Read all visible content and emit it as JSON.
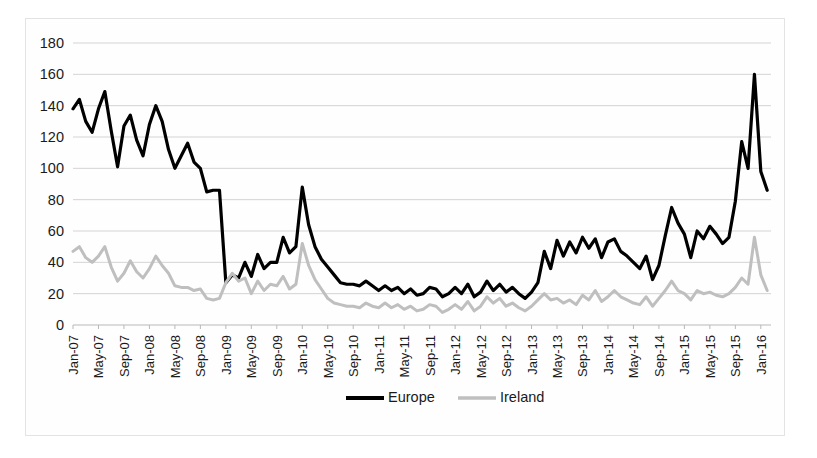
{
  "chart_data": {
    "type": "line",
    "title": "",
    "subtitle": "",
    "xlabel": "",
    "ylabel": "",
    "ylim": [
      0,
      180
    ],
    "ytick_values": [
      0,
      20,
      40,
      60,
      80,
      100,
      120,
      140,
      160,
      180
    ],
    "ytick_labels": [
      "0",
      "20",
      "40",
      "60",
      "80",
      "100",
      "120",
      "140",
      "160",
      "180"
    ],
    "grid": true,
    "grid_axis": "y",
    "legend_position": "bottom",
    "legend_entries": [
      "Europe",
      "Ireland"
    ],
    "x_start": "Jan-07",
    "x_end": "Feb-16",
    "x_tick_step_months": 4,
    "xtick_labels": [
      "Jan-07",
      "May-07",
      "Sep-07",
      "Jan-08",
      "May-08",
      "Sep-08",
      "Jan-09",
      "May-09",
      "Sep-09",
      "Jan-10",
      "May-10",
      "Sep-10",
      "Jan-11",
      "May-11",
      "Sep-11",
      "Jan-12",
      "May-12",
      "Sep-12",
      "Jan-13",
      "May-13",
      "Sep-13",
      "Jan-14",
      "May-14",
      "Sep-14",
      "Jan-15",
      "May-15",
      "Sep-15",
      "Jan-16"
    ],
    "x": [
      "Jan-07",
      "Feb-07",
      "Mar-07",
      "Apr-07",
      "May-07",
      "Jun-07",
      "Jul-07",
      "Aug-07",
      "Sep-07",
      "Oct-07",
      "Nov-07",
      "Dec-07",
      "Jan-08",
      "Feb-08",
      "Mar-08",
      "Apr-08",
      "May-08",
      "Jun-08",
      "Jul-08",
      "Aug-08",
      "Sep-08",
      "Oct-08",
      "Nov-08",
      "Dec-08",
      "Jan-09",
      "Feb-09",
      "Mar-09",
      "Apr-09",
      "May-09",
      "Jun-09",
      "Jul-09",
      "Aug-09",
      "Sep-09",
      "Oct-09",
      "Nov-09",
      "Dec-09",
      "Jan-10",
      "Feb-10",
      "Mar-10",
      "Apr-10",
      "May-10",
      "Jun-10",
      "Jul-10",
      "Aug-10",
      "Sep-10",
      "Oct-10",
      "Nov-10",
      "Dec-10",
      "Jan-11",
      "Feb-11",
      "Mar-11",
      "Apr-11",
      "May-11",
      "Jun-11",
      "Jul-11",
      "Aug-11",
      "Sep-11",
      "Oct-11",
      "Nov-11",
      "Dec-11",
      "Jan-12",
      "Feb-12",
      "Mar-12",
      "Apr-12",
      "May-12",
      "Jun-12",
      "Jul-12",
      "Aug-12",
      "Sep-12",
      "Oct-12",
      "Nov-12",
      "Dec-12",
      "Jan-13",
      "Feb-13",
      "Mar-13",
      "Apr-13",
      "May-13",
      "Jun-13",
      "Jul-13",
      "Aug-13",
      "Sep-13",
      "Oct-13",
      "Nov-13",
      "Dec-13",
      "Jan-14",
      "Feb-14",
      "Mar-14",
      "Apr-14",
      "May-14",
      "Jun-14",
      "Jul-14",
      "Aug-14",
      "Sep-14",
      "Oct-14",
      "Nov-14",
      "Dec-14",
      "Jan-15",
      "Feb-15",
      "Mar-15",
      "Apr-15",
      "May-15",
      "Jun-15",
      "Jul-15",
      "Aug-15",
      "Sep-15",
      "Oct-15",
      "Nov-15",
      "Dec-15",
      "Jan-16",
      "Feb-16"
    ],
    "series": [
      {
        "name": "Europe",
        "color": "#000000",
        "line_width": 3.2,
        "values": [
          138,
          144,
          130,
          123,
          138,
          149,
          124,
          101,
          127,
          134,
          118,
          108,
          128,
          140,
          130,
          112,
          100,
          108,
          116,
          104,
          100,
          85,
          86,
          86,
          27,
          32,
          30,
          40,
          31,
          45,
          36,
          40,
          40,
          56,
          46,
          50,
          88,
          64,
          50,
          42,
          37,
          32,
          27,
          26,
          26,
          25,
          28,
          25,
          22,
          25,
          22,
          24,
          20,
          23,
          19,
          20,
          24,
          23,
          18,
          20,
          24,
          20,
          26,
          18,
          21,
          28,
          22,
          26,
          21,
          24,
          20,
          17,
          21,
          27,
          47,
          36,
          54,
          44,
          53,
          46,
          56,
          49,
          55,
          43,
          53,
          55,
          47,
          44,
          40,
          36,
          44,
          29,
          38,
          57,
          75,
          65,
          58,
          43,
          60,
          55,
          63,
          58,
          52,
          56,
          79,
          117,
          100,
          160,
          98,
          86
        ]
      },
      {
        "name": "Ireland",
        "color": "#bfbfbf",
        "line_width": 3.0,
        "values": [
          47,
          50,
          43,
          40,
          44,
          50,
          37,
          28,
          33,
          41,
          34,
          30,
          36,
          44,
          38,
          33,
          25,
          24,
          24,
          22,
          23,
          17,
          16,
          17,
          27,
          33,
          28,
          30,
          20,
          28,
          22,
          26,
          25,
          31,
          23,
          26,
          52,
          38,
          29,
          23,
          17,
          14,
          13,
          12,
          12,
          11,
          14,
          12,
          11,
          14,
          11,
          13,
          10,
          12,
          9,
          10,
          13,
          12,
          8,
          10,
          13,
          10,
          15,
          9,
          12,
          18,
          14,
          17,
          12,
          14,
          11,
          9,
          12,
          16,
          20,
          16,
          17,
          14,
          16,
          13,
          19,
          16,
          22,
          15,
          18,
          22,
          18,
          16,
          14,
          13,
          18,
          12,
          17,
          22,
          28,
          22,
          20,
          16,
          22,
          20,
          21,
          19,
          18,
          20,
          24,
          30,
          26,
          56,
          32,
          22
        ]
      }
    ]
  },
  "legend": {
    "europe_label": "Europe",
    "ireland_label": "Ireland"
  }
}
